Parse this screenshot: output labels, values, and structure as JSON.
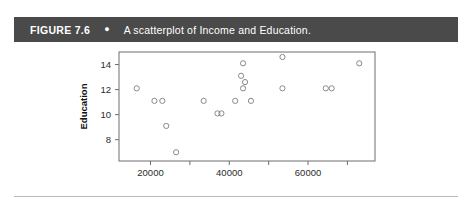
{
  "header": {
    "figure_label": "FIGURE 7.6",
    "bullet": "●",
    "caption": "A scatterplot of Income and Education.",
    "background_color": "#4a4a4a",
    "text_color": "#ffffff"
  },
  "chart_data": {
    "type": "scatter",
    "title": "A scatterplot of Income and Education.",
    "xlabel": "Income",
    "ylabel": "Education",
    "xlim": [
      12000,
      77000
    ],
    "ylim": [
      6.3,
      15.0
    ],
    "grid": false,
    "legend": null,
    "x_ticks": [
      20000,
      30000,
      40000,
      50000,
      60000,
      70000
    ],
    "x_tick_labels": [
      "20000",
      "",
      "40000",
      "",
      "60000",
      ""
    ],
    "y_ticks": [
      8,
      10,
      12,
      14
    ],
    "y_tick_labels": [
      "8",
      "10",
      "12",
      "14"
    ],
    "marker": {
      "shape": "circle",
      "filled": false,
      "edge_color": "#8a8a8a",
      "radius_px": 2.6
    },
    "points": [
      {
        "x": 16500,
        "y": 12.1
      },
      {
        "x": 21000,
        "y": 11.1
      },
      {
        "x": 23000,
        "y": 11.1
      },
      {
        "x": 24000,
        "y": 9.1
      },
      {
        "x": 26500,
        "y": 7.0
      },
      {
        "x": 33500,
        "y": 11.1
      },
      {
        "x": 37000,
        "y": 10.1
      },
      {
        "x": 38000,
        "y": 10.1
      },
      {
        "x": 41500,
        "y": 11.1
      },
      {
        "x": 43000,
        "y": 13.1
      },
      {
        "x": 43500,
        "y": 14.1
      },
      {
        "x": 43500,
        "y": 12.1
      },
      {
        "x": 44000,
        "y": 12.6
      },
      {
        "x": 45500,
        "y": 11.1
      },
      {
        "x": 53500,
        "y": 14.6
      },
      {
        "x": 53500,
        "y": 12.1
      },
      {
        "x": 64500,
        "y": 12.1
      },
      {
        "x": 66000,
        "y": 12.1
      },
      {
        "x": 73000,
        "y": 14.1
      }
    ],
    "n_points": 19,
    "axis_color": "#6e6e6e"
  }
}
